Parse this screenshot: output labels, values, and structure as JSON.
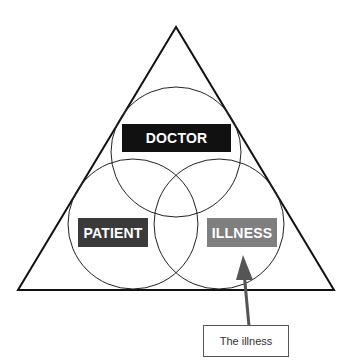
{
  "diagram": {
    "type": "triangle-venn",
    "circles": [
      {
        "id": "doctor",
        "label": "DOCTOR",
        "fill": "#111111"
      },
      {
        "id": "patient",
        "label": "PATIENT",
        "fill": "#3a3a3a"
      },
      {
        "id": "illness",
        "label": "ILLNESS",
        "fill": "#7f7f7f"
      }
    ],
    "callout": {
      "text": "The illness",
      "points_to": "illness"
    }
  }
}
